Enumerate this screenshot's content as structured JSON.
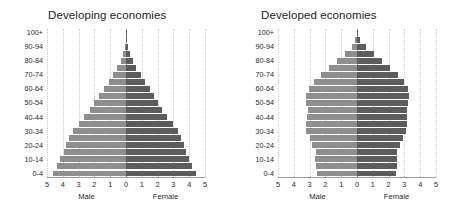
{
  "figure": {
    "male_color": "#8e8e8e",
    "female_color": "#5c5c5c",
    "gridline_color": "#c9c9c9",
    "axis_color": "#9a9a9a"
  },
  "panels": [
    {
      "id": "developing",
      "title": "Developing economies",
      "male_axis_label": "Male",
      "female_axis_label": "Female"
    },
    {
      "id": "developed",
      "title": "Developed economies",
      "male_axis_label": "Male",
      "female_axis_label": "Female"
    }
  ],
  "axis": {
    "tick_labels": [
      "5",
      "4",
      "3",
      "2",
      "1",
      "0",
      "1",
      "2",
      "3",
      "4",
      "5"
    ],
    "tick_values": [
      -5,
      -4,
      -3,
      -2,
      -1,
      0,
      1,
      2,
      3,
      4,
      5
    ],
    "xlim": [
      -5,
      5
    ]
  },
  "age_groups": [
    "0-4",
    "5-9",
    "10-14",
    "15-19",
    "20-24",
    "25-29",
    "30-34",
    "35-39",
    "40-44",
    "45-49",
    "50-54",
    "55-59",
    "60-64",
    "65-69",
    "70-74",
    "75-79",
    "80-84",
    "85-89",
    "90-94",
    "95-99",
    "100+"
  ],
  "age_tick_labels": [
    "0-4",
    "",
    "10-14",
    "",
    "20-24",
    "",
    "30-34",
    "",
    "40-44",
    "",
    "50-54",
    "",
    "60-64",
    "",
    "70-74",
    "",
    "80-84",
    "",
    "90-94",
    "",
    "100+"
  ],
  "chart_data": {
    "type": "bar",
    "subtype": "population-pyramid",
    "xlabel": "",
    "ylabel": "Age group",
    "xlim": [
      -5,
      5
    ],
    "xticks": [
      -5,
      -4,
      -3,
      -2,
      -1,
      0,
      1,
      2,
      3,
      4,
      5
    ],
    "xtick_labels": [
      "5",
      "4",
      "3",
      "2",
      "1",
      "0",
      "1",
      "2",
      "3",
      "4",
      "5"
    ],
    "grid": true,
    "legend": "none",
    "units": "percent of total population",
    "categories": [
      "0-4",
      "5-9",
      "10-14",
      "15-19",
      "20-24",
      "25-29",
      "30-34",
      "35-39",
      "40-44",
      "45-49",
      "50-54",
      "55-59",
      "60-64",
      "65-69",
      "70-74",
      "75-79",
      "80-84",
      "85-89",
      "90-94",
      "95-99",
      "100+"
    ],
    "panels": [
      {
        "name": "Developing economies",
        "series": [
          {
            "name": "Male",
            "direction": "left",
            "values": [
              4.6,
              4.35,
              4.15,
              3.95,
              3.8,
              3.6,
              3.35,
              3.0,
              2.65,
              2.3,
              2.0,
              1.7,
              1.4,
              1.1,
              0.82,
              0.55,
              0.33,
              0.17,
              0.07,
              0.02,
              0.01
            ]
          },
          {
            "name": "Female",
            "direction": "right",
            "values": [
              4.45,
              4.2,
              4.0,
              3.8,
              3.65,
              3.5,
              3.3,
              2.95,
              2.6,
              2.3,
              2.05,
              1.78,
              1.5,
              1.2,
              0.92,
              0.65,
              0.42,
              0.23,
              0.1,
              0.03,
              0.01
            ]
          }
        ]
      },
      {
        "name": "Developed economies",
        "series": [
          {
            "name": "Male",
            "direction": "left",
            "values": [
              2.55,
              2.6,
              2.65,
              2.6,
              2.85,
              3.0,
              3.2,
              3.2,
              3.15,
              3.1,
              3.2,
              3.2,
              3.05,
              2.7,
              2.3,
              1.75,
              1.25,
              0.78,
              0.33,
              0.1,
              0.02
            ]
          },
          {
            "name": "Female",
            "direction": "right",
            "values": [
              2.45,
              2.5,
              2.5,
              2.5,
              2.7,
              2.9,
              3.1,
              3.15,
              3.15,
              3.15,
              3.25,
              3.3,
              3.2,
              2.95,
              2.6,
              2.1,
              1.6,
              1.1,
              0.55,
              0.2,
              0.05
            ]
          }
        ]
      }
    ]
  }
}
